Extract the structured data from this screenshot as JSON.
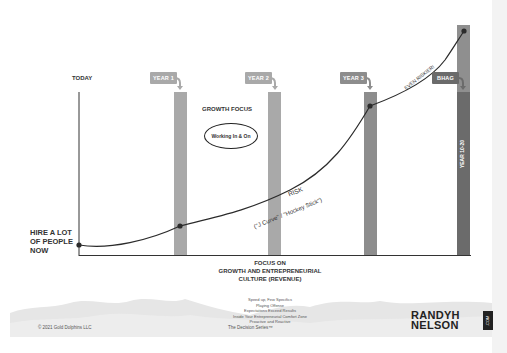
{
  "diagram": {
    "axis_label_top": "TODAY",
    "y_start_label_lines": [
      "HIRE A LOT",
      "OF PEOPLE",
      "NOW"
    ],
    "milestones": [
      {
        "tag": "YEAR 1",
        "bar_color": "#a9a9a9",
        "tag_color": "#a9a9a9"
      },
      {
        "tag": "YEAR 2",
        "bar_color": "#a9a9a9",
        "tag_color": "#a9a9a9"
      },
      {
        "tag": "YEAR 3",
        "bar_color": "#8d8d8d",
        "tag_color": "#8d8d8d"
      },
      {
        "tag": "BHAG",
        "bar_color": "#6b6b6b",
        "tag_color": "#6b6b6b",
        "bar_top_color": "#8f8f8f",
        "bar_label": "YEAR 10-20"
      }
    ],
    "growth_focus_title": "GROWTH FOCUS",
    "growth_focus_ellipse": "Working In & On",
    "curve_label_risk": "RISK",
    "curve_label_jcurve": "(\"J Curve\" / \"Hockey Stick\")",
    "curve_label_even_riskier": "EVEN RISKIER!",
    "curve_color": "#2b2b2b",
    "x_axis_title_lines": [
      "FOCUS ON",
      "GROWTH AND ENTREPRENEURIAL",
      "CULTURE (REVENUE)"
    ],
    "bullets": [
      "Speed up, Few Specifics",
      "Playing Offense",
      "Expectations Exceed Results",
      "Inside Your Entrepreneurial Comfort Zone",
      "Proactive and Reactive"
    ]
  },
  "footer": {
    "copyright": "© 2021 Gold Dolphins LLC",
    "series": "The Decision Series™",
    "logo_line1": "RANDYH",
    "logo_line2": "NELSON",
    "logo_dotcom": ".COM"
  }
}
